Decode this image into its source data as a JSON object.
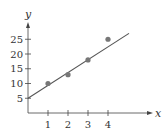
{
  "chart_data": {
    "type": "scatter",
    "title": "",
    "xlabel": "x",
    "ylabel": "y",
    "x_ticks": [
      "1",
      "2",
      "3",
      "4"
    ],
    "y_ticks": [
      "5",
      "10",
      "15",
      "20",
      "25"
    ],
    "points": [
      {
        "x": 1,
        "y": 10
      },
      {
        "x": 2,
        "y": 13
      },
      {
        "x": 3,
        "y": 18
      },
      {
        "x": 4,
        "y": 25
      }
    ],
    "fit_line": {
      "x_start": 0,
      "y_start": 5,
      "x_end": 5.05,
      "y_end": 27
    },
    "xlim": [
      0,
      5.3
    ],
    "ylim": [
      0,
      28
    ],
    "grid": false,
    "colors": {
      "axis": "#444444",
      "point": "#777777",
      "line": "#555555"
    }
  }
}
